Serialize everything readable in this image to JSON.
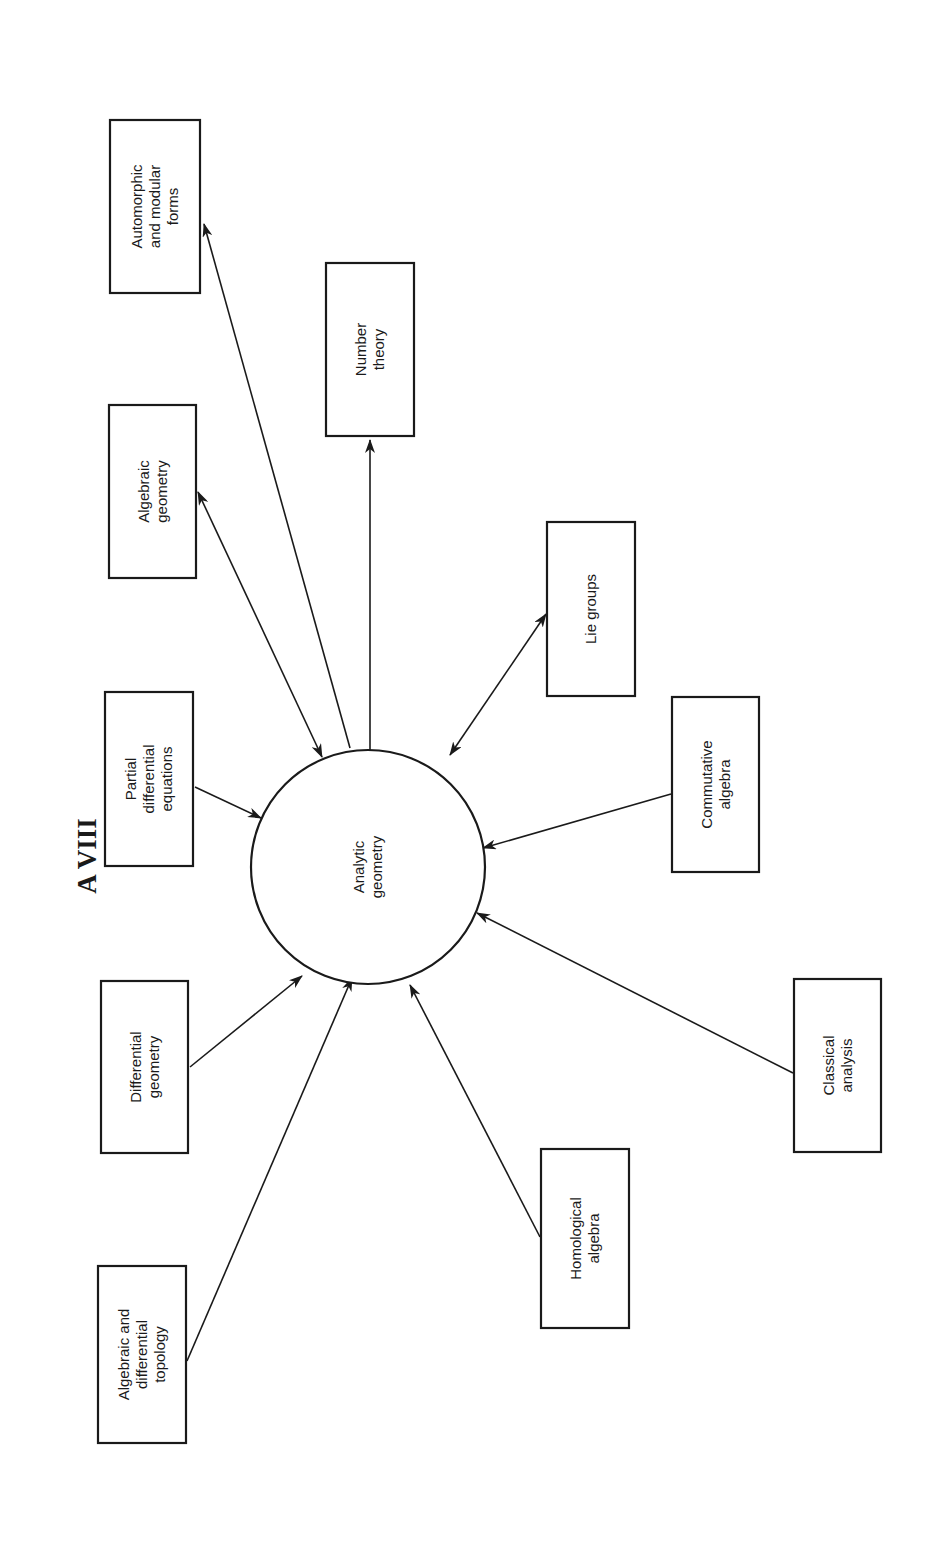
{
  "title": "A VIII",
  "center": {
    "label_lines": [
      "Analytic",
      "geometry"
    ],
    "cx": 368,
    "cy": 867,
    "r": 117
  },
  "style": {
    "stroke": "#1a1a1a",
    "background": "#ffffff"
  },
  "nodes": [
    {
      "id": "automorphic-and-modular-forms",
      "lines": [
        "Automorphic",
        "and modular",
        "forms"
      ],
      "x": 110,
      "y": 120,
      "w": 90,
      "h": 173,
      "edge": {
        "from": [
          350,
          748
        ],
        "to": [
          204,
          224
        ],
        "arrow": "to-box"
      }
    },
    {
      "id": "number-theory",
      "lines": [
        "Number",
        "theory"
      ],
      "x": 326,
      "y": 263,
      "w": 88,
      "h": 173,
      "edge": {
        "from": [
          370,
          750
        ],
        "to": [
          370,
          440
        ],
        "arrow": "to-box"
      }
    },
    {
      "id": "algebraic-geometry",
      "lines": [
        "Algebraic",
        "geometry"
      ],
      "x": 109,
      "y": 405,
      "w": 87,
      "h": 173,
      "edge": {
        "from": [
          322,
          757
        ],
        "to": [
          198,
          492
        ],
        "arrow": "both"
      }
    },
    {
      "id": "partial-differential-equations",
      "lines": [
        "Partial",
        "differential",
        "equations"
      ],
      "x": 105,
      "y": 692,
      "w": 88,
      "h": 174,
      "edge": {
        "from": [
          195,
          787
        ],
        "to": [
          261,
          818
        ],
        "arrow": "to-center"
      }
    },
    {
      "id": "lie-groups",
      "lines": [
        "Lie groups"
      ],
      "x": 547,
      "y": 522,
      "w": 88,
      "h": 174,
      "edge": {
        "from": [
          546,
          614
        ],
        "to": [
          450,
          755
        ],
        "arrow": "both"
      }
    },
    {
      "id": "commutative-algebra",
      "lines": [
        "Commutative",
        "algebra"
      ],
      "x": 672,
      "y": 697,
      "w": 87,
      "h": 175,
      "edge": {
        "from": [
          671,
          794
        ],
        "to": [
          483,
          848
        ],
        "arrow": "to-center"
      }
    },
    {
      "id": "differential-geometry",
      "lines": [
        "Differential",
        "geometry"
      ],
      "x": 101,
      "y": 981,
      "w": 87,
      "h": 172,
      "edge": {
        "from": [
          190,
          1067
        ],
        "to": [
          302,
          976
        ],
        "arrow": "to-center"
      }
    },
    {
      "id": "classical-analysis",
      "lines": [
        "Classical",
        "analysis"
      ],
      "x": 794,
      "y": 979,
      "w": 87,
      "h": 173,
      "edge": {
        "from": [
          793,
          1073
        ],
        "to": [
          477,
          913
        ],
        "arrow": "to-center"
      }
    },
    {
      "id": "homological-algebra",
      "lines": [
        "Homological",
        "algebra"
      ],
      "x": 541,
      "y": 1149,
      "w": 88,
      "h": 179,
      "edge": {
        "from": [
          540,
          1237
        ],
        "to": [
          410,
          985
        ],
        "arrow": "to-center"
      }
    },
    {
      "id": "algebraic-and-differential-topology",
      "lines": [
        "Algebraic and",
        "differential",
        "topology"
      ],
      "x": 98,
      "y": 1266,
      "w": 88,
      "h": 177,
      "edge": {
        "from": [
          187,
          1361
        ],
        "to": [
          352,
          978
        ],
        "arrow": "to-center"
      }
    }
  ]
}
